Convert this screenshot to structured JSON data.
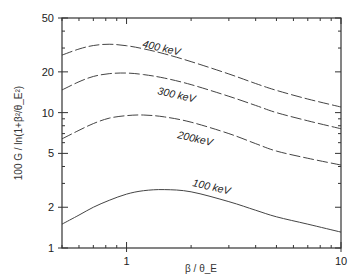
{
  "chart_data": {
    "type": "line",
    "title": "",
    "xlabel": "β / θ_E",
    "ylabel": "100 G / ln(1+β²/θ_E²)",
    "xscale": "log",
    "yscale": "log",
    "xlim": [
      0.5,
      10
    ],
    "ylim": [
      1,
      50
    ],
    "x_ticks": [
      {
        "value": 1,
        "label": "1"
      },
      {
        "value": 10,
        "label": "10"
      }
    ],
    "y_ticks": [
      {
        "value": 1,
        "label": "1"
      },
      {
        "value": 2,
        "label": "2"
      },
      {
        "value": 5,
        "label": "5"
      },
      {
        "value": 10,
        "label": "10"
      },
      {
        "value": 20,
        "label": "20"
      },
      {
        "value": 50,
        "label": "50"
      }
    ],
    "grid": false,
    "legend": "inline curve labels",
    "x": [
      0.5,
      0.6,
      0.7,
      0.83,
      1.0,
      1.2,
      1.5,
      2.0,
      3.0,
      4.0,
      5.0,
      7.0,
      10.0
    ],
    "series": [
      {
        "name": "400 keV",
        "style": "long-dash",
        "label_pos": [
          142,
          47
        ],
        "label_rot": 13,
        "values": [
          26.6,
          29.5,
          31.3,
          32.0,
          31.2,
          29.6,
          27.2,
          23.8,
          19.3,
          16.4,
          14.6,
          12.6,
          11.0
        ]
      },
      {
        "name": "300 keV",
        "style": "long-dash",
        "label_pos": [
          157,
          94
        ],
        "label_rot": 13,
        "values": [
          14.7,
          16.9,
          18.5,
          19.4,
          19.6,
          19.1,
          18.0,
          16.1,
          13.2,
          11.3,
          10.0,
          8.7,
          7.6
        ]
      },
      {
        "name": "200keV",
        "style": "long-dash",
        "label_pos": [
          177,
          138
        ],
        "label_rot": 13,
        "values": [
          6.4,
          7.4,
          8.3,
          9.1,
          9.5,
          9.6,
          9.3,
          8.5,
          7.0,
          5.9,
          5.2,
          4.6,
          4.1
        ]
      },
      {
        "name": "100 keV",
        "style": "solid",
        "label_pos": [
          192,
          186
        ],
        "label_rot": 13,
        "values": [
          1.5,
          1.75,
          2.0,
          2.25,
          2.5,
          2.65,
          2.7,
          2.6,
          2.2,
          1.9,
          1.7,
          1.5,
          1.31
        ]
      }
    ]
  }
}
